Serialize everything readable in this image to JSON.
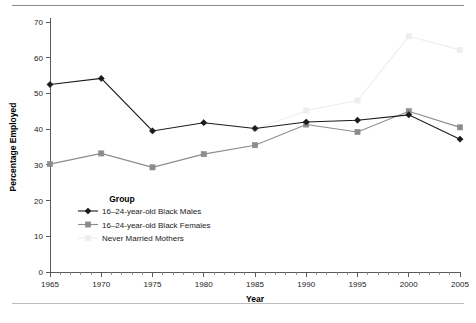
{
  "chart_data": {
    "type": "line",
    "title": "",
    "xlabel": "Year",
    "ylabel": "Percentage Employed",
    "xlim": [
      1965,
      2005
    ],
    "ylim": [
      0,
      70
    ],
    "xticks": [
      1965,
      1970,
      1975,
      1980,
      1985,
      1990,
      1995,
      2000,
      2005
    ],
    "yticks": [
      0,
      10,
      20,
      30,
      40,
      50,
      60,
      70
    ],
    "xtick_labels": [
      "1965",
      "1970",
      "1975",
      "1980",
      "1985",
      "1990",
      "1995",
      "2000",
      "2005"
    ],
    "ytick_labels": [
      "0",
      "10",
      "20",
      "30",
      "40",
      "50",
      "60",
      "70"
    ],
    "x_minor_step": 1,
    "grid": false,
    "legend_position": "inside-lower-left",
    "legend_title": "Group",
    "series": [
      {
        "name": "16–24-year-old Black Males",
        "color": "#1a1a1a",
        "marker": "diamond",
        "x": [
          1965,
          1970,
          1975,
          1980,
          1985,
          1990,
          1995,
          2000,
          2005
        ],
        "values": [
          52.5,
          54.2,
          39.5,
          41.8,
          40.2,
          42.0,
          42.5,
          44.0,
          37.2
        ]
      },
      {
        "name": "16–24-year-old Black Females",
        "color": "#8c8c8c",
        "marker": "square",
        "x": [
          1965,
          1970,
          1975,
          1980,
          1985,
          1990,
          1995,
          2000,
          2005
        ],
        "values": [
          30.2,
          33.2,
          29.3,
          33.0,
          35.5,
          41.3,
          39.2,
          45.0,
          40.5
        ]
      },
      {
        "name": "Never Married Mothers",
        "color": "#ededed",
        "marker": "square",
        "x": [
          1985,
          1990,
          1995,
          2000,
          2005
        ],
        "values": [
          40.0,
          45.2,
          48.0,
          66.0,
          62.2
        ]
      }
    ]
  },
  "axes": {
    "xlabel": "Year",
    "ylabel": "Percentage Employed"
  },
  "legend": {
    "title": "Group",
    "items": [
      {
        "label": "16–24-year-old Black Males"
      },
      {
        "label": "16–24-year-old Black Females"
      },
      {
        "label": "Never Married Mothers"
      }
    ]
  }
}
